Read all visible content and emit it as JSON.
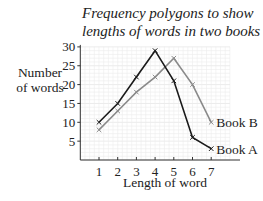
{
  "chart_data": {
    "type": "line",
    "title": "Frequency polygons to show lengths of words in two books",
    "title_lines": [
      "Frequency polygons to show",
      "lengths of words in two books"
    ],
    "xlabel": "Length of word",
    "ylabel": "Number of words",
    "ylabel_lines": [
      "Number",
      "of words"
    ],
    "x": [
      1,
      2,
      3,
      4,
      5,
      6,
      7
    ],
    "x_ticks": [
      "1",
      "2",
      "3",
      "4",
      "5",
      "6",
      "7"
    ],
    "y_ticks": [
      "5",
      "10",
      "15",
      "20",
      "25",
      "30"
    ],
    "xlim": [
      0,
      8
    ],
    "ylim": [
      0,
      30
    ],
    "grid": true,
    "legend_position": "inline-right",
    "series": [
      {
        "name": "Book A",
        "values": [
          10,
          15,
          22,
          29,
          21,
          6,
          3
        ],
        "color": "#1a1a1a",
        "marker": "x"
      },
      {
        "name": "Book B",
        "values": [
          8,
          13,
          18,
          22,
          27,
          20,
          10
        ],
        "color": "#8a8a8a",
        "marker": "x"
      }
    ]
  }
}
